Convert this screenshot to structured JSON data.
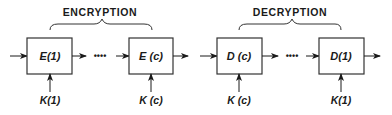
{
  "encryption": {
    "title": "ENCRYPTION",
    "blocks": [
      {
        "label": "E(1)",
        "key": "K(1)"
      },
      {
        "label": "E (c)",
        "key": "K (c)"
      }
    ],
    "ellipsis": "••••"
  },
  "decryption": {
    "title": "DECRYPTION",
    "blocks": [
      {
        "label": "D (c)",
        "key": "K (c)"
      },
      {
        "label": "D(1)",
        "key": "K(1)"
      }
    ],
    "ellipsis": "••••"
  }
}
